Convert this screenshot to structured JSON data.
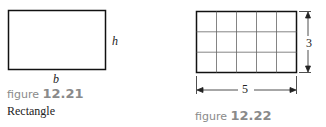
{
  "figure_1": {
    "label_prefix": "figure",
    "label_number": "12.21",
    "caption": "Rectangle",
    "height_label": "h",
    "base_label": "b"
  },
  "figure_2": {
    "label_prefix": "figure",
    "label_number": "12.22",
    "height_value": "3",
    "width_value": "5",
    "grid": {
      "columns": 5,
      "rows": 3
    }
  }
}
